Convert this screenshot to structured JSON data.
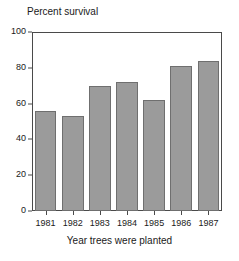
{
  "chart_data": {
    "type": "bar",
    "title": "",
    "xlabel": "Year trees were planted",
    "ylabel": "Percent survival",
    "categories": [
      "1981",
      "1982",
      "1983",
      "1984",
      "1985",
      "1986",
      "1987"
    ],
    "values": [
      56,
      53,
      70,
      72,
      62,
      81,
      84
    ],
    "ylim": [
      0,
      100
    ],
    "yticks": [
      "0",
      "20",
      "40",
      "60",
      "80",
      "100"
    ],
    "ytick_values": [
      0,
      20,
      40,
      60,
      80,
      100
    ],
    "grid": false,
    "legend": null,
    "bar_color": "#9b9b9b",
    "bar_edge_color": "#6f6f6f",
    "axis_color": "#4a4a4a",
    "background_color": "#ffffff"
  }
}
